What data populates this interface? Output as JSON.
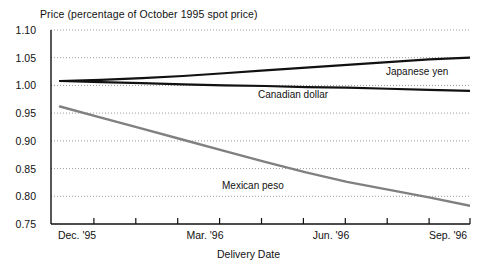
{
  "chart_data": {
    "type": "line",
    "title": "Price (percentage of October 1995 spot price)",
    "xlabel": "Delivery Date",
    "ylabel": "Price (percentage of October 1995 spot price)",
    "ylim": [
      0.75,
      1.1
    ],
    "ytick_labels": [
      "1.10",
      "1.05",
      "1.00",
      "0.95",
      "0.90",
      "0.85",
      "0.80",
      "0.75"
    ],
    "ytick_values": [
      1.1,
      1.05,
      1.0,
      0.95,
      0.9,
      0.85,
      0.8,
      0.75
    ],
    "xtick_labels": [
      "Dec. '95",
      "Mar. '96",
      "Jun. '96",
      "Sep. '96"
    ],
    "xtick_positions": [
      0,
      3,
      6,
      9
    ],
    "x_minor_tick_count": 16,
    "xlim": [
      0,
      10
    ],
    "grid": "horizontal-dotted",
    "legend_position": "inline-annotations",
    "x": [
      0,
      1,
      2,
      3,
      4,
      5,
      6,
      7,
      8,
      9,
      10
    ],
    "series": [
      {
        "name": "Japanese yen",
        "color": "#111111",
        "values": [
          1.008,
          1.01,
          1.013,
          1.017,
          1.022,
          1.027,
          1.032,
          1.037,
          1.042,
          1.047,
          1.05
        ]
      },
      {
        "name": "Canadian dollar",
        "color": "#111111",
        "values": [
          1.008,
          1.006,
          1.004,
          1.002,
          1.0,
          0.999,
          0.997,
          0.996,
          0.994,
          0.992,
          0.99
        ]
      },
      {
        "name": "Mexican peso",
        "color": "#808080",
        "values": [
          0.962,
          0.942,
          0.922,
          0.902,
          0.882,
          0.862,
          0.843,
          0.826,
          0.812,
          0.798,
          0.783
        ]
      }
    ]
  },
  "annotations": {
    "yen_label": "Japanese yen",
    "cad_label": "Canadian dollar",
    "peso_label": "Mexican peso"
  },
  "colors": {
    "axis": "#111111",
    "grid": "#9a9a9a",
    "dark_series": "#111111",
    "gray_series": "#808080",
    "background": "#ffffff"
  }
}
